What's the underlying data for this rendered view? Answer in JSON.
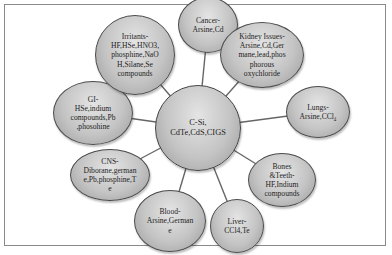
{
  "diagram": {
    "type": "hub-and-spoke",
    "center": {
      "label": "C-Si,\nCdTe,CdS,CIGS"
    },
    "nodes": [
      {
        "id": "cancer",
        "label": "Cancer-\nArsine,Cd"
      },
      {
        "id": "kidney",
        "label": "Kidney Issues-\nArsine,Cd,Ger\nmane,lead,phos\nphorous\noxychloride"
      },
      {
        "id": "lungs",
        "label": "Lungs-\nArsine,CCl₄"
      },
      {
        "id": "bones",
        "label": "Bones\n&Teeth-\nHF,Indium\ncompounds"
      },
      {
        "id": "liver",
        "label": "Liver-\nCCl4,Te"
      },
      {
        "id": "blood",
        "label": "Blood-\nArsine,German\ne"
      },
      {
        "id": "cns",
        "label": "CNS-\nDiborane,german\ne,Pb,phosphine,T\ne"
      },
      {
        "id": "gi",
        "label": "GI-\nHSe,indium\ncompounds,Pb\n,phosohine"
      },
      {
        "id": "irritants",
        "label": "Irritants-\nHF,HSe,HNO3,\nphosphine,NaO\nH,Silane,Se\ncompounds"
      }
    ],
    "colors": {
      "node_fill": "#c4c4c4",
      "node_border": "#4a4a4a",
      "edge": "#666666",
      "frame": "#8a8a8a"
    }
  }
}
